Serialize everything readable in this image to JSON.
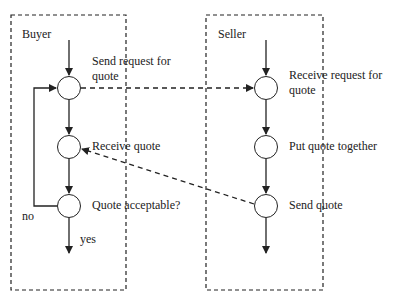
{
  "diagram": {
    "lanes": [
      {
        "id": "buyer",
        "title": "Buyer"
      },
      {
        "id": "seller",
        "title": "Seller"
      }
    ],
    "buyer": {
      "step1": {
        "line1": "Send request for",
        "line2": "quote"
      },
      "step2": {
        "label": "Receive quote"
      },
      "step3": {
        "label": "Quote acceptable?"
      },
      "branch_no": "no",
      "branch_yes": "yes"
    },
    "seller": {
      "step1": {
        "line1": "Receive request for",
        "line2": "quote"
      },
      "step2": {
        "label": "Put quote together"
      },
      "step3": {
        "label": "Send quote"
      }
    },
    "messages": [
      {
        "from": "buyer.step1",
        "to": "seller.step1",
        "style": "dashed"
      },
      {
        "from": "seller.step3",
        "to": "buyer.step2",
        "style": "dashed"
      }
    ],
    "colors": {
      "stroke": "#222222",
      "background": "#ffffff"
    }
  }
}
